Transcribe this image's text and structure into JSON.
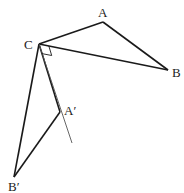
{
  "diagram": {
    "type": "geometry-rotation",
    "points": {
      "A": {
        "label": "A",
        "x": 103,
        "y": 22
      },
      "B": {
        "label": "B",
        "x": 168,
        "y": 70
      },
      "C": {
        "label": "C",
        "x": 39,
        "y": 44
      },
      "A_prime": {
        "label": "A′",
        "x": 60,
        "y": 112
      },
      "B_prime": {
        "label": "B′",
        "x": 14,
        "y": 177
      }
    },
    "segments": [
      {
        "from": "C",
        "to": "A",
        "style": "thick"
      },
      {
        "from": "A",
        "to": "B",
        "style": "thick"
      },
      {
        "from": "C",
        "to": "B",
        "style": "thick"
      },
      {
        "from": "C",
        "to": "A_prime",
        "style": "thick"
      },
      {
        "from": "A_prime",
        "to": "B_prime",
        "style": "thick"
      },
      {
        "from": "C",
        "to": "B_prime",
        "style": "thick"
      },
      {
        "from": "A_prime",
        "to": "extension",
        "style": "thin"
      }
    ],
    "extension_end": {
      "x": 72,
      "y": 143
    },
    "right_angle_marker": {
      "at": "C",
      "between": [
        "B",
        "A_prime"
      ]
    },
    "colors": {
      "stroke": "#1a1a1a",
      "thin_stroke": "#555555",
      "label": "#222222"
    }
  },
  "labels": {
    "A": "A",
    "B": "B",
    "C": "C",
    "A_prime": "A′",
    "B_prime": "B′"
  }
}
